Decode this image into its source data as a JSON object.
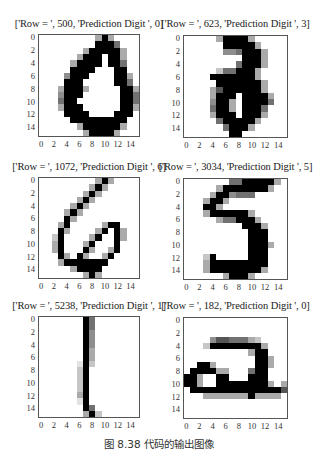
{
  "caption": "图 8.38   代码的输出图像",
  "chart_data": [
    {
      "type": "heatmap",
      "title": "['Row = ', 500, 'Prediction Digit ', 0]",
      "row": 500,
      "prediction": 0,
      "xticks": [
        "0",
        "2",
        "4",
        "6",
        "8",
        "10",
        "12",
        "14"
      ],
      "yticks": [
        "0",
        "2",
        "4",
        "6",
        "8",
        "10",
        "12",
        "14"
      ],
      "cmap": "gray_r",
      "grid": [
        "0000000003930000",
        "0000000009995000",
        "0000000399999300",
        "0000003999099300",
        "0000039999099500",
        "0000099990009900",
        "0000499900009930",
        "0000999000009950",
        "0003999300000993",
        "0004999000000995",
        "0005990000000995",
        "0003999000000993",
        "0000999900009990",
        "0000099999999900",
        "0000003999999300",
        "0000000399993000"
      ]
    },
    {
      "type": "heatmap",
      "title": "['Row = ', 623, 'Prediction Digit ', 3]",
      "row": 623,
      "prediction": 3,
      "xticks": [
        "0",
        "2",
        "4",
        "6",
        "8",
        "10",
        "12",
        "14"
      ],
      "yticks": [
        "0",
        "2",
        "4",
        "6",
        "8",
        "10",
        "12",
        "14"
      ],
      "cmap": "gray_r",
      "grid": [
        "0000039999300000",
        "0000009999930000",
        "0000004459993000",
        "0000000009993000",
        "0000000059993000",
        "0000025599930000",
        "0000999999930000",
        "0000099999993000",
        "0000369999993000",
        "0000399909999300",
        "0000499309999500",
        "0000599309995000",
        "0000399909993000",
        "0000059999930000",
        "0000005999300000",
        "0000000990000000"
      ]
    },
    {
      "type": "heatmap",
      "title": "['Row = ', 1072, 'Prediction Digit ', 6]",
      "row": 1072,
      "prediction": 6,
      "xticks": [
        "0",
        "2",
        "4",
        "6",
        "8",
        "10",
        "12",
        "14"
      ],
      "yticks": [
        "0",
        "2",
        "4",
        "6",
        "8",
        "10",
        "12",
        "14"
      ],
      "cmap": "gray_r",
      "grid": [
        "0000000003930000",
        "0000000039300000",
        "0000000393000000",
        "0000003930000000",
        "0000039300000000",
        "0000393000000000",
        "0000930000000000",
        "0003900000399000",
        "0009300003909300",
        "0029000039009300",
        "0039000390009000",
        "0039000930039000",
        "0009309300390000",
        "0003999999900000",
        "0000039999000000",
        "0000000393000000"
      ]
    },
    {
      "type": "heatmap",
      "title": "['Row = ', 3034, 'Prediction Digit ', 5]",
      "row": 3034,
      "prediction": 5,
      "xticks": [
        "0",
        "2",
        "4",
        "6",
        "8",
        "10",
        "12",
        "14"
      ],
      "yticks": [
        "0",
        "2",
        "4",
        "6",
        "8",
        "10",
        "12",
        "14"
      ],
      "cmap": "gray_r",
      "grid": [
        "0000000559999930",
        "0000039999999300",
        "0000399455500000",
        "0003993000000000",
        "0009930000000000",
        "0003999999300000",
        "0000035599930000",
        "0000000009993000",
        "0000000000999000",
        "0000000000999000",
        "0000000000999300",
        "0000000000999000",
        "0002900000999000",
        "0003999999999000",
        "0003999999993000",
        "0000003999300000"
      ]
    },
    {
      "type": "heatmap",
      "title": "['Row = ', 5238, 'Prediction Digit ', 1]",
      "row": 5238,
      "prediction": 1,
      "xticks": [
        "0",
        "2",
        "4",
        "6",
        "8",
        "10",
        "12",
        "14"
      ],
      "yticks": [
        "0",
        "2",
        "4",
        "6",
        "8",
        "10",
        "12",
        "14"
      ],
      "cmap": "gray_r",
      "grid": [
        "0000000950000000",
        "0000000950000000",
        "0000000940000000",
        "0000000940000000",
        "0000000940000000",
        "0000000930000000",
        "0000000930000000",
        "0000001920000000",
        "0000002900000000",
        "0000002900000000",
        "0000002900000000",
        "0000002900000000",
        "0000003900000000",
        "0000001900000000",
        "0000000950000000",
        "0000000392000000"
      ]
    },
    {
      "type": "heatmap",
      "title": "['Row = ', 182, 'Prediction Digit ', 0]",
      "row": 182,
      "prediction": 0,
      "xticks": [
        "0",
        "2",
        "4",
        "6",
        "8",
        "10",
        "12",
        "14"
      ],
      "yticks": [
        "0",
        "2",
        "4",
        "6",
        "8",
        "10",
        "12",
        "14"
      ],
      "cmap": "gray_r",
      "grid": [
        "0000000000000000",
        "0000000000000000",
        "0000000000000000",
        "0000466555320000",
        "0002999999993000",
        "0000000000399000",
        "0000000000099300",
        "0099300000099300",
        "0999933000599000",
        "9930099000999000",
        "9930099999999303",
        "0999999999999996",
        "0003333333933330",
        "0000000000000000",
        "0000000000000000",
        "0000000000000000"
      ]
    }
  ]
}
